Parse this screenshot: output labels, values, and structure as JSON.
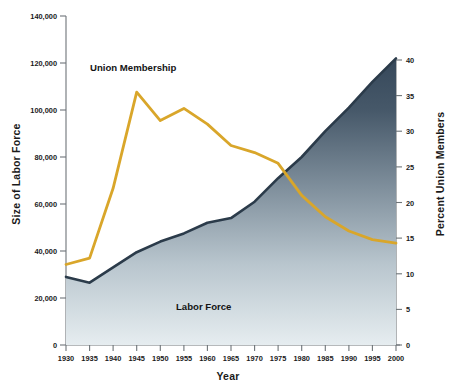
{
  "chart_data": {
    "type": "line",
    "title": "",
    "xlabel": "Year",
    "ylabel_left": "Size of Labor Force",
    "ylabel_right": "Percent Union Members",
    "grid": false,
    "legend_position": "inline-annotations",
    "x": [
      1930,
      1935,
      1940,
      1945,
      1950,
      1955,
      1960,
      1965,
      1970,
      1975,
      1980,
      1985,
      1990,
      1995,
      2000
    ],
    "xlim": [
      1930,
      2002
    ],
    "xticks": [
      "1930",
      "1935",
      "1940",
      "1945",
      "1950",
      "1955",
      "1960",
      "1965",
      "1970",
      "1975",
      "1980",
      "1985",
      "1990",
      "1995",
      "2000"
    ],
    "left_axis": {
      "ylim": [
        0,
        140000
      ],
      "yticks": [
        "0",
        "20,000",
        "40,000",
        "60,000",
        "80,000",
        "100,000",
        "120,000",
        "140,000"
      ],
      "ytick_values": [
        0,
        20000,
        40000,
        60000,
        80000,
        100000,
        120000,
        140000
      ]
    },
    "right_axis": {
      "ylim": [
        0,
        40
      ],
      "yticks": [
        "0",
        "5",
        "10",
        "15",
        "20",
        "25",
        "30",
        "35",
        "40"
      ],
      "ytick_values": [
        0,
        5,
        10,
        15,
        20,
        25,
        30,
        35,
        40
      ]
    },
    "series": [
      {
        "name": "Labor Force",
        "axis": "left",
        "type": "area",
        "color": "#2b3b4a",
        "fill": "gradient-dark-to-light",
        "values": [
          29000,
          26500,
          33000,
          39500,
          44000,
          47500,
          52000,
          54000,
          61000,
          71000,
          80000,
          91000,
          101000,
          112000,
          122000
        ]
      },
      {
        "name": "Union Membership",
        "axis": "right",
        "type": "line",
        "color": "#d9a62a",
        "values": [
          11.3,
          12.2,
          22.0,
          35.5,
          31.5,
          33.2,
          31.0,
          28.0,
          27.0,
          25.5,
          21.0,
          18.0,
          16.0,
          14.8,
          14.3
        ]
      }
    ],
    "annotations": [
      {
        "text": "Union Membership",
        "x": 1938,
        "y": 36
      },
      {
        "text": "Labor Force",
        "x": 1968,
        "y": 6
      }
    ]
  },
  "labels": {
    "xlabel": "Year",
    "ylabel_left": "Size of Labor Force",
    "ylabel_right": "Percent Union Members",
    "series_union": "Union Membership",
    "series_labor": "Labor Force"
  },
  "colors": {
    "union_line": "#d9a62a",
    "labor_outline": "#2b3b4a",
    "labor_fill_top": "#3a4b5c",
    "labor_fill_bottom": "#e3eaee",
    "text": "#1a1a1a",
    "axis": "#6e7478"
  }
}
